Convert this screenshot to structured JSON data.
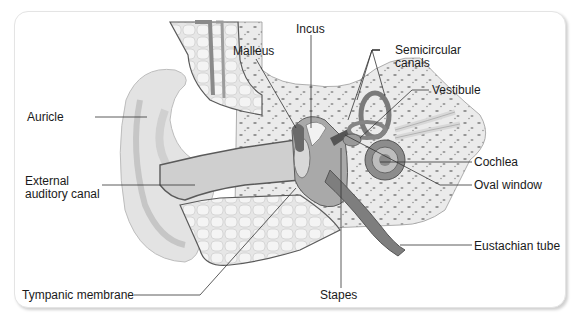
{
  "diagram": {
    "labels": {
      "auricle": "Auricle",
      "external_canal_1": "External",
      "external_canal_2": "auditory canal",
      "tympanic": "Tympanic membrane",
      "malleus": "Malleus",
      "incus": "Incus",
      "semicircular_1": "Semicircular",
      "semicircular_2": "canals",
      "vestibule": "Vestibule",
      "cochlea": "Cochlea",
      "oval_window": "Oval window",
      "eustachian": "Eustachian tube",
      "stapes": "Stapes"
    },
    "colors": {
      "skin": "#e2e2e2",
      "skin_dark": "#b9b9b9",
      "bone": "#ececec",
      "bone_spot": "#8f8f8f",
      "canal": "#9a9a9a",
      "outline": "#5a5a5a",
      "leader": "#333333"
    }
  }
}
